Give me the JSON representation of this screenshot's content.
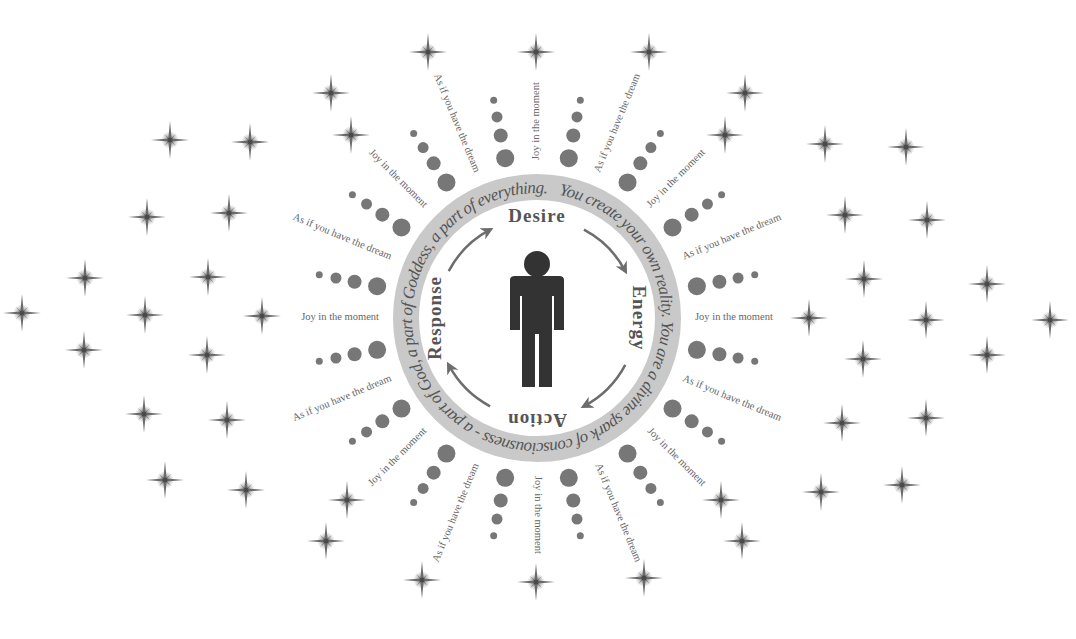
{
  "diagram": {
    "center": {
      "x": 537,
      "y": 318
    },
    "colors": {
      "background": "#ffffff",
      "ring": "#c9c9c9",
      "ring_text": "#555555",
      "figure": "#333333",
      "dots": "#777777",
      "stars": "#6a6a6a",
      "labels": "#666666",
      "cycle_text": "#555555",
      "arrows": "#6d6d6d"
    },
    "ring_text": "You create your own reality. You are a divine spark of consciousness - a part of God, a part of Goddess, a part of everything.",
    "cycle": [
      {
        "label": "Desire",
        "position": "top"
      },
      {
        "label": "Energy",
        "position": "right"
      },
      {
        "label": "Action",
        "position": "bottom"
      },
      {
        "label": "Response",
        "position": "left"
      }
    ],
    "spoke_labels": {
      "even": "Joy in the moment",
      "odd": "As if you have the dream",
      "count": 16
    },
    "dot_rows": {
      "count": 16,
      "dots_per_row": 4,
      "diameters": [
        18,
        14,
        11,
        7
      ]
    },
    "center_figure": "person-icon",
    "stars": [
      [
        170,
        140
      ],
      [
        250,
        142
      ],
      [
        147,
        217
      ],
      [
        229,
        213
      ],
      [
        85,
        278
      ],
      [
        208,
        277
      ],
      [
        22,
        313
      ],
      [
        145,
        315
      ],
      [
        262,
        316
      ],
      [
        84,
        350
      ],
      [
        207,
        355
      ],
      [
        144,
        414
      ],
      [
        227,
        420
      ],
      [
        165,
        480
      ],
      [
        246,
        490
      ],
      [
        825,
        144
      ],
      [
        906,
        147
      ],
      [
        845,
        215
      ],
      [
        927,
        220
      ],
      [
        864,
        279
      ],
      [
        987,
        284
      ],
      [
        809,
        318
      ],
      [
        926,
        320
      ],
      [
        1050,
        320
      ],
      [
        863,
        359
      ],
      [
        987,
        355
      ],
      [
        842,
        423
      ],
      [
        926,
        418
      ],
      [
        821,
        492
      ],
      [
        902,
        485
      ],
      [
        331,
        93
      ],
      [
        428,
        52
      ],
      [
        536,
        52
      ],
      [
        649,
        52
      ],
      [
        745,
        93
      ],
      [
        351,
        135
      ],
      [
        725,
        135
      ],
      [
        347,
        500
      ],
      [
        326,
        541
      ],
      [
        422,
        580
      ],
      [
        536,
        582
      ],
      [
        644,
        578
      ],
      [
        721,
        500
      ],
      [
        742,
        541
      ]
    ]
  }
}
